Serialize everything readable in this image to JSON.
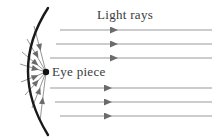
{
  "diagram": {
    "title": "Light rays",
    "eye_piece_label": "Eye piece",
    "colors": {
      "mirror": "#1a1a1a",
      "incident_ray": "#9a9a9a",
      "reflected_ray": "#8a8a8a",
      "arrowhead": "#6b6b6b",
      "focal_point": "#111111",
      "text": "#3a3a3a",
      "background": "#ffffff"
    },
    "mirror": {
      "name": "concave-parabolic-mirror",
      "top_end": {
        "x": 48,
        "y": 8
      },
      "vertex": {
        "x": 20,
        "y": 70
      },
      "bottom_end": {
        "x": 48,
        "y": 135
      },
      "stroke_width": 2.4
    },
    "focal_point": {
      "name": "eye-piece-point",
      "x": 46,
      "y": 72,
      "radius": 3.2
    },
    "incident_rays": {
      "count": 6,
      "direction": "right-to-left",
      "x_start": 212,
      "rays": [
        {
          "y": 30,
          "x_end": 60,
          "arrow_x": 111
        },
        {
          "y": 44,
          "x_end": 56,
          "arrow_x": 111
        },
        {
          "y": 58,
          "x_end": 50,
          "arrow_x": 111
        },
        {
          "y": 88,
          "x_end": 50,
          "arrow_x": 105
        },
        {
          "y": 102,
          "x_end": 55,
          "arrow_x": 105
        },
        {
          "y": 116,
          "x_end": 60,
          "arrow_x": 105
        }
      ]
    },
    "reflected_rays": {
      "count": 8,
      "direction": "converging-from-mirror-to-eye-piece",
      "rays": [
        {
          "mirror_x": 34,
          "mirror_y": 26,
          "arrow_x": 38,
          "arrow_y": 32
        },
        {
          "mirror_x": 27,
          "mirror_y": 39,
          "arrow_x": 32,
          "arrow_y": 44
        },
        {
          "mirror_x": 22,
          "mirror_y": 52,
          "arrow_x": 28,
          "arrow_y": 55
        },
        {
          "mirror_x": 20,
          "mirror_y": 64,
          "arrow_x": 27,
          "arrow_y": 66
        },
        {
          "mirror_x": 21,
          "mirror_y": 82,
          "arrow_x": 28,
          "arrow_y": 80
        },
        {
          "mirror_x": 25,
          "mirror_y": 95,
          "arrow_x": 31,
          "arrow_y": 91
        },
        {
          "mirror_x": 32,
          "mirror_y": 108,
          "arrow_x": 37,
          "arrow_y": 103
        },
        {
          "mirror_x": 40,
          "mirror_y": 121,
          "arrow_x": 44,
          "arrow_y": 114
        }
      ]
    }
  }
}
